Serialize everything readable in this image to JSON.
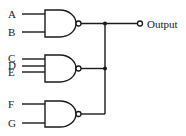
{
  "diagram": {
    "type": "logic-circuit",
    "gates": [
      {
        "id": "nand1",
        "type": "NAND",
        "inputs": [
          "A",
          "B"
        ]
      },
      {
        "id": "nand2",
        "type": "NAND",
        "inputs": [
          "C",
          "D",
          "E"
        ]
      },
      {
        "id": "nand3",
        "type": "NAND",
        "inputs": [
          "F",
          "G"
        ]
      }
    ],
    "inputs": {
      "A": "A",
      "B": "B",
      "C": "C",
      "D": "D",
      "E": "E",
      "F": "F",
      "G": "G"
    },
    "output_label": "Output",
    "colors": {
      "stroke": "#1a1a1a",
      "background": "#ffffff"
    }
  }
}
